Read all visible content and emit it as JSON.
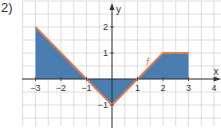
{
  "problem_label": "2)",
  "colors": {
    "fill": "#4a7db0",
    "line": "#e07a4f",
    "grid": "#c8c8c8",
    "axis": "#333333"
  },
  "chart_data": {
    "type": "area",
    "title": "",
    "function_label": "f",
    "xlabel": "x",
    "ylabel": "y",
    "x_ticks": [
      -3,
      -2,
      -1,
      1,
      2,
      3,
      4
    ],
    "x_tick_labels": [
      "−3",
      "−2",
      "−1",
      "1",
      "2",
      "3",
      "4"
    ],
    "y_ticks": [
      -1,
      1,
      2
    ],
    "y_tick_labels": [
      "−1",
      "1",
      "2"
    ],
    "xlim": [
      -3.5,
      4.3
    ],
    "ylim": [
      -1.8,
      2.9
    ],
    "grid": true,
    "grid_step": 0.5,
    "points": [
      {
        "x": -3,
        "y": 2
      },
      {
        "x": -1,
        "y": 0
      },
      {
        "x": 0,
        "y": -1
      },
      {
        "x": 1,
        "y": 0
      },
      {
        "x": 2,
        "y": 1
      },
      {
        "x": 3,
        "y": 1
      }
    ],
    "shaded_region": "between f and x-axis from x=-3 to x=3"
  }
}
